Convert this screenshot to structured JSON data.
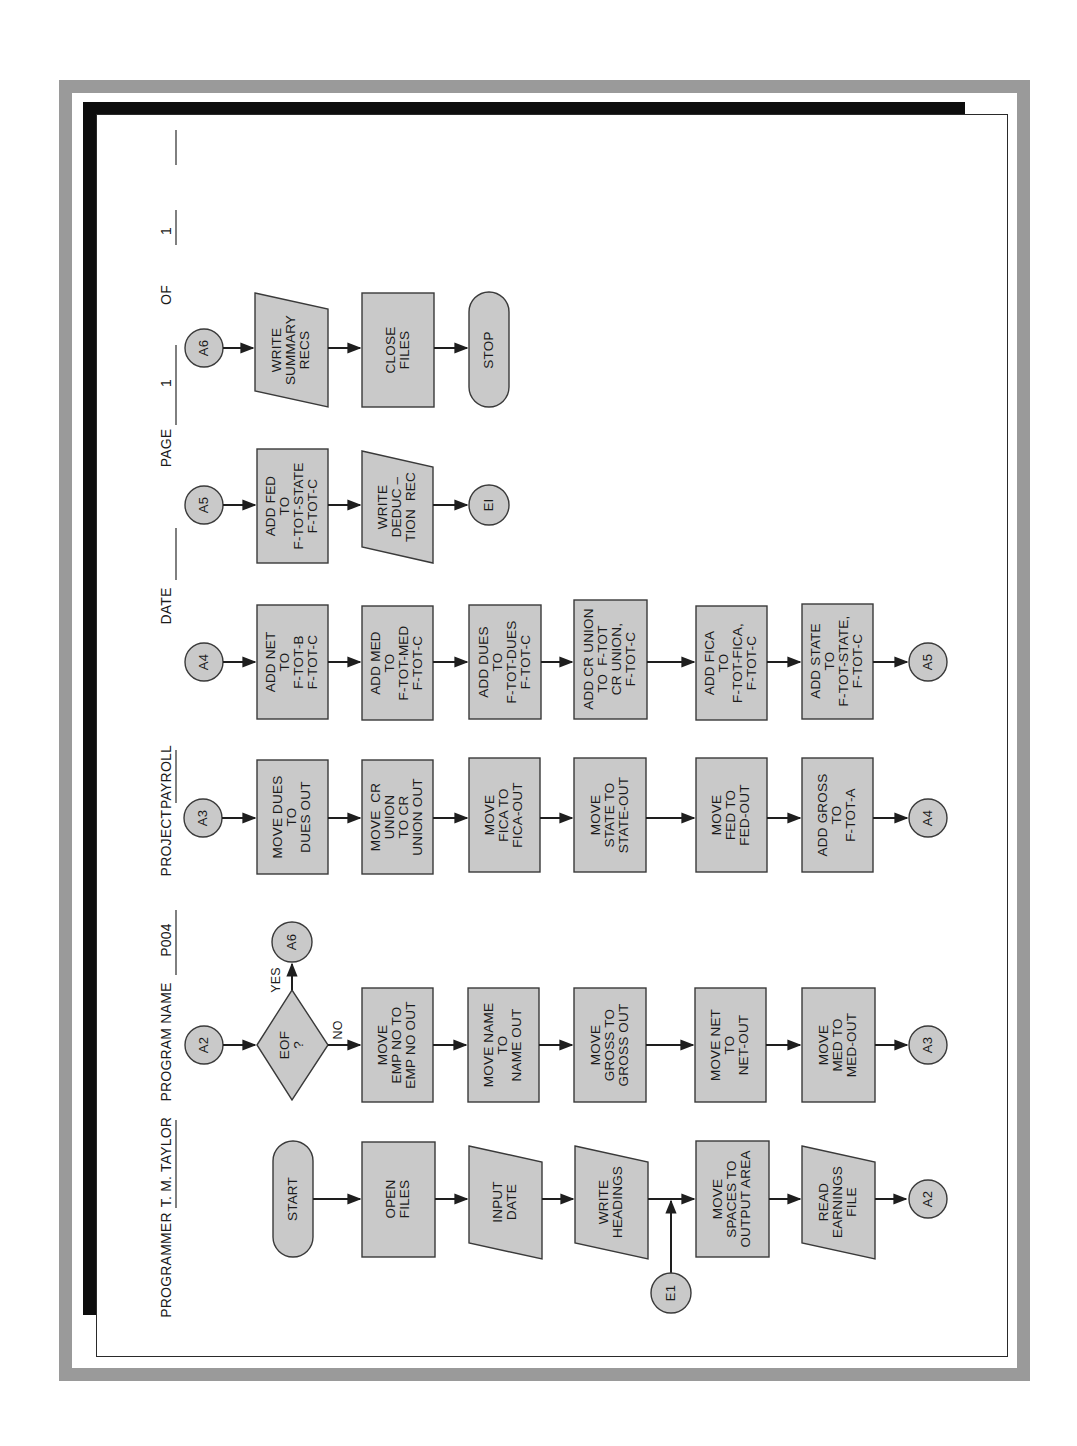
{
  "header": {
    "programmer_label": "PROGRAMMER",
    "programmer_value": "T. M. TAYLOR",
    "program_name_label": "PROGRAM NAME",
    "program_name_value": "P004",
    "project_label": "PROJECT",
    "project_value": "PAYROLL",
    "date_label": "DATE",
    "date_value": "",
    "page_label": "PAGE",
    "page_value": "1",
    "of_label": "OF",
    "of_value": "1"
  },
  "colors": {
    "shape_fill": "#c9c9c9",
    "frame_gray": "#9a9a9a",
    "strip_black": "#0d0d0d"
  },
  "flow": {
    "col1": {
      "start": "START",
      "open_files": "OPEN\nFILES",
      "input_date": "INPUT\nDATE",
      "write_headings": "WRITE\nHEADINGS",
      "move_spaces": "MOVE\nSPACES TO\nOUTPUT AREA",
      "read_earnings": "READ\nEARNINGS\nFILE",
      "to_connector": "A2",
      "entry_connector": "E1"
    },
    "col2": {
      "connector_in": "A2",
      "decision": "EOF\n?",
      "yes_label": "YES",
      "no_label": "NO",
      "yes_connector": "A6",
      "move_emp": "MOVE\nEMP NO TO\nEMP NO OUT",
      "move_name": "MOVE NAME\nTO\nNAME OUT",
      "move_gross": "MOVE\nGROSS TO\nGROSS OUT",
      "move_net": "MOVE NET\nTO\nNET-OUT",
      "move_med": "MOVE\nMED TO\nMED-OUT",
      "to_connector": "A3"
    },
    "col3": {
      "connector_in": "A3",
      "move_dues": "MOVE DUES\nTO\nDUES OUT",
      "move_cr_union": "MOVE  CR\nUNION\nTO CR\nUNION OUT",
      "move_fica": "MOVE\nFICA TO\nFICA-OUT",
      "move_state": "MOVE\nSTATE TO\nSTATE-OUT",
      "move_fed": "MOVE\nFED TO\nFED-OUT",
      "add_gross": "ADD GROSS\nTO\nF-TOT-A",
      "to_connector": "A4"
    },
    "col4": {
      "connector_in": "A4",
      "add_net": "ADD NET\nTO\nF-TOT-B\nF-TOT-C",
      "add_med": "ADD MED\nTO\nF-TOT-MED\nF-TOT-C",
      "add_dues": "ADD DUES\nTO\nF-TOT-DUES\nF-TOT-C",
      "add_cr_union": "ADD CR UNION\nTO  F-TOT\nCR UNION,\nF-TOT-C",
      "add_fica": "ADD FICA\nTO\nF-TOT-FICA,\nF-TOT-C",
      "add_state": "ADD STATE\nTO\nF-TOT-STATE,\nF-TOT-C",
      "to_connector": "A5"
    },
    "col5": {
      "connector_in": "A5",
      "add_fed": "ADD FED\nTO\nF-TOT-STATE\nF-TOT-C",
      "write_deduction": "WRITE\nDEDUC –\nTION  REC",
      "to_connector": "EI"
    },
    "col6": {
      "connector_in": "A6",
      "write_summary": "WRITE\nSUMMARY\nRECS",
      "close_files": "CLOSE\nFILES",
      "stop": "STOP"
    }
  }
}
